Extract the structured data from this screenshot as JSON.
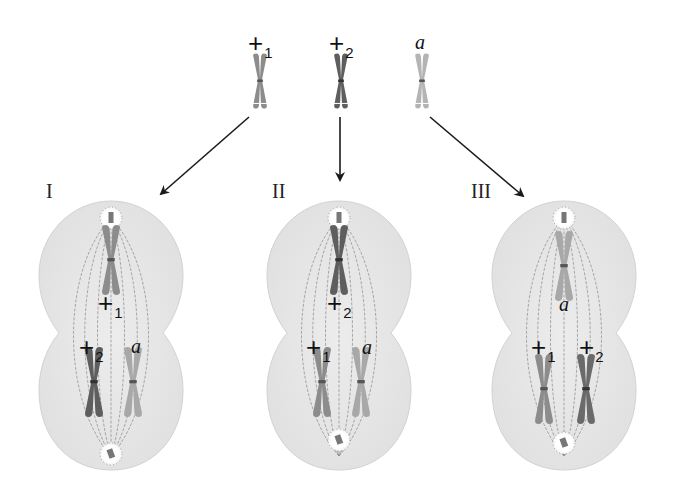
{
  "figure": {
    "colors": {
      "cell_fill": "#e6e6e6",
      "cell_edge": "#d2d2d2",
      "spindle": "#8a8a8a",
      "arrow": "#1a1a1a",
      "chrom_plus1": "#8c8c8c",
      "chrom_plus2": "#5e5e5e",
      "chrom_a": "#b4b4b4"
    },
    "top_chromosomes": [
      {
        "id": "plus1",
        "symbol": "+",
        "subscript": "1"
      },
      {
        "id": "plus2",
        "symbol": "+",
        "subscript": "2"
      },
      {
        "id": "a",
        "symbol": "a",
        "subscript": ""
      }
    ],
    "cells": [
      {
        "label": "I",
        "upper": {
          "symbol": "+",
          "subscript": "1"
        },
        "lower_left": {
          "symbol": "+",
          "subscript": "2"
        },
        "lower_right": {
          "symbol": "a",
          "subscript": ""
        }
      },
      {
        "label": "II",
        "upper": {
          "symbol": "+",
          "subscript": "2"
        },
        "lower_left": {
          "symbol": "+",
          "subscript": "1"
        },
        "lower_right": {
          "symbol": "a",
          "subscript": ""
        }
      },
      {
        "label": "III",
        "upper": {
          "symbol": "a",
          "subscript": ""
        },
        "lower_left": {
          "symbol": "+",
          "subscript": "1"
        },
        "lower_right": {
          "symbol": "+",
          "subscript": "2"
        }
      }
    ]
  }
}
